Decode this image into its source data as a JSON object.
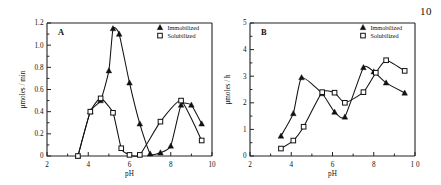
{
  "figure": {
    "page_number": "10",
    "marker_names": {
      "immobilized": "filled-triangle-marker",
      "solubilized": "open-square-marker"
    }
  },
  "chart_data": [
    {
      "type": "line",
      "panel_label": "A",
      "title": "",
      "xlabel": "pH",
      "ylabel": "μmoles / min",
      "xlim": [
        2,
        10
      ],
      "ylim": [
        0,
        1.2
      ],
      "xticks": [
        2,
        4,
        6,
        8,
        10
      ],
      "xticklabels": [
        "2",
        "4",
        "6",
        "8",
        "10"
      ],
      "yticks": [
        0,
        0.2,
        0.4,
        0.6,
        0.8,
        1.0,
        1.2
      ],
      "yticklabels": [
        "0",
        "0.2",
        "0.4",
        "0.6",
        "0.8",
        "1.0",
        "1.2"
      ],
      "grid": false,
      "legend_position": "top-right",
      "series": [
        {
          "name": "Immobilized",
          "marker": "filled-triangle",
          "x": [
            3.5,
            4.1,
            4.6,
            5.0,
            5.2,
            5.5,
            6.0,
            6.5,
            7.0,
            7.5,
            8.0,
            8.5,
            9.0,
            9.5
          ],
          "y": [
            0.0,
            0.4,
            0.5,
            0.77,
            1.15,
            1.1,
            0.66,
            0.29,
            0.02,
            0.03,
            0.09,
            0.46,
            0.46,
            0.29
          ]
        },
        {
          "name": "Solubilized",
          "marker": "open-square",
          "x": [
            3.5,
            4.1,
            4.6,
            5.2,
            5.6,
            6.0,
            6.5,
            7.5,
            8.5,
            9.5
          ],
          "y": [
            0.0,
            0.4,
            0.52,
            0.39,
            0.07,
            0.01,
            0.01,
            0.31,
            0.5,
            0.14
          ]
        }
      ]
    },
    {
      "type": "line",
      "panel_label": "B",
      "title": "",
      "xlabel": "pH",
      "ylabel": "μmoles / h",
      "xlim": [
        2,
        10
      ],
      "ylim": [
        0,
        5
      ],
      "xticks": [
        2,
        4,
        6,
        8,
        10
      ],
      "xticklabels": [
        "2",
        "4",
        "6",
        "8",
        "1 0"
      ],
      "yticks": [
        0,
        1,
        2,
        3,
        4,
        5
      ],
      "yticklabels": [
        "0",
        "1",
        "2",
        "3",
        "4",
        "5"
      ],
      "grid": false,
      "legend_position": "top-right",
      "series": [
        {
          "name": "Immobilized",
          "marker": "filled-triangle",
          "x": [
            3.5,
            4.1,
            4.5,
            5.5,
            6.1,
            6.6,
            7.5,
            8.0,
            8.6,
            9.5
          ],
          "y": [
            0.75,
            1.6,
            2.95,
            2.35,
            1.65,
            1.47,
            3.33,
            3.17,
            2.75,
            2.37
          ]
        },
        {
          "name": "Solubilized",
          "marker": "open-square",
          "x": [
            3.5,
            4.1,
            4.6,
            5.5,
            6.1,
            6.6,
            7.5,
            8.1,
            8.6,
            9.5
          ],
          "y": [
            0.28,
            0.58,
            1.1,
            2.4,
            2.38,
            2.0,
            2.4,
            3.13,
            3.6,
            3.2
          ]
        }
      ]
    }
  ]
}
